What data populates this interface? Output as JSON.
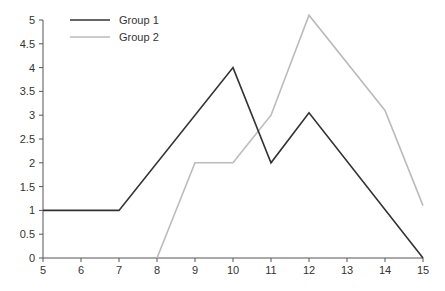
{
  "chart_data": {
    "type": "line",
    "title": "",
    "xlabel": "",
    "ylabel": "",
    "xlim": [
      5,
      15
    ],
    "ylim": [
      0,
      5
    ],
    "grid": false,
    "legend_position": "top-left",
    "x_ticks": [
      "5",
      "6",
      "7",
      "8",
      "9",
      "10",
      "11",
      "12",
      "13",
      "14",
      "15"
    ],
    "y_ticks": [
      "0",
      "0.5",
      "1",
      "1.5",
      "2",
      "2.5",
      "3",
      "3.5",
      "4",
      "4.5",
      "5"
    ],
    "series": [
      {
        "name": "Group 1",
        "color": "#333333",
        "points": [
          [
            5,
            1
          ],
          [
            7,
            1
          ],
          [
            10,
            4
          ],
          [
            11,
            2
          ],
          [
            12,
            3.05
          ],
          [
            15,
            0
          ]
        ]
      },
      {
        "name": "Group 2",
        "color": "#bbbbbb",
        "points": [
          [
            8,
            0
          ],
          [
            9,
            2
          ],
          [
            10,
            2
          ],
          [
            11,
            3
          ],
          [
            12,
            5.1
          ],
          [
            14,
            3.1
          ],
          [
            15,
            1.1
          ]
        ]
      }
    ]
  }
}
